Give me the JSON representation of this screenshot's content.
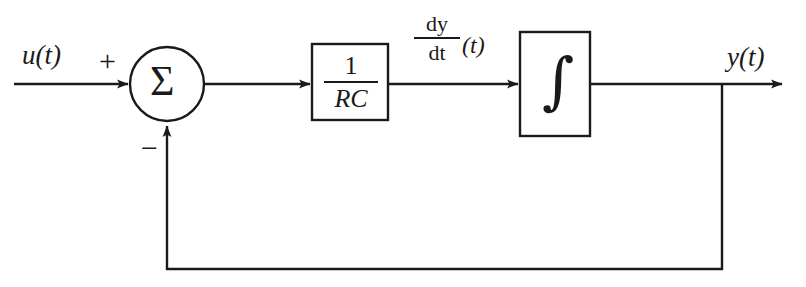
{
  "diagram": {
    "background_color": "#ffffff",
    "stroke_color": "#1a1a1a",
    "signals": {
      "input_label": "u(t)",
      "output_label": "y(t)",
      "derivative_numerator": "dy",
      "derivative_denominator": "dt",
      "derivative_argument": "(t)"
    },
    "summing_junction": {
      "glyph": "Σ",
      "positive_sign": "+",
      "negative_sign": "−",
      "center_x": 167,
      "center_y": 84,
      "radius": 37
    },
    "blocks": [
      {
        "name": "gain-block",
        "numerator": "1",
        "denominator": "RC",
        "x": 312,
        "y": 44,
        "width": 76,
        "height": 76
      },
      {
        "name": "integrator-block",
        "glyph": "∫",
        "x": 520,
        "y": 32,
        "width": 70,
        "height": 104
      }
    ],
    "wires": [
      {
        "name": "input-wire",
        "from_x": 14,
        "from_y": 84,
        "to_x": 130,
        "to_y": 84,
        "arrow": true
      },
      {
        "name": "error-wire",
        "from_x": 204,
        "from_y": 84,
        "to_x": 312,
        "to_y": 84,
        "arrow": true
      },
      {
        "name": "gain-to-integrator-wire",
        "from_x": 388,
        "from_y": 84,
        "to_x": 520,
        "to_y": 84,
        "arrow": true
      },
      {
        "name": "output-wire",
        "from_x": 590,
        "from_y": 84,
        "to_x": 784,
        "to_y": 84,
        "arrow": true
      },
      {
        "name": "feedback-down-wire",
        "from_x": 722,
        "from_y": 84,
        "to_x": 722,
        "to_y": 269,
        "arrow": false
      },
      {
        "name": "feedback-bottom-wire",
        "from_x": 722,
        "from_y": 269,
        "to_x": 167,
        "to_y": 269,
        "arrow": false
      },
      {
        "name": "feedback-up-wire",
        "from_x": 167,
        "from_y": 269,
        "to_x": 167,
        "to_y": 124,
        "arrow": true
      }
    ],
    "junction": {
      "name": "output-tap",
      "x": 722,
      "y": 84
    }
  }
}
